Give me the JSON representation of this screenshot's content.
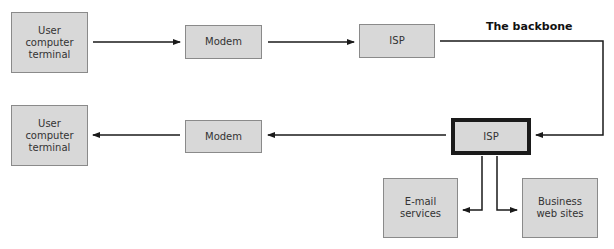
{
  "diagram": {
    "title_label": "The backbone",
    "nodes": {
      "user_top": {
        "label": "User\ncomputer\nterminal"
      },
      "modem_top": {
        "label": "Modem"
      },
      "isp_top": {
        "label": "ISP"
      },
      "isp_bottom": {
        "label": "ISP"
      },
      "modem_bottom": {
        "label": "Modem"
      },
      "user_bottom": {
        "label": "User\ncomputer\nterminal"
      },
      "email": {
        "label": "E-mail\nservices"
      },
      "business": {
        "label": "Business\nweb sites"
      }
    },
    "edges": [
      {
        "from": "user_top",
        "to": "modem_top"
      },
      {
        "from": "modem_top",
        "to": "isp_top"
      },
      {
        "from": "isp_top",
        "to": "isp_bottom",
        "label": "The backbone"
      },
      {
        "from": "isp_bottom",
        "to": "modem_bottom"
      },
      {
        "from": "modem_bottom",
        "to": "user_bottom"
      },
      {
        "from": "isp_bottom",
        "to": "email"
      },
      {
        "from": "isp_bottom",
        "to": "business"
      }
    ],
    "colors": {
      "box_fill": "#d8d8d8",
      "box_border": "#8a8a8a",
      "line": "#1a1a1a"
    }
  }
}
